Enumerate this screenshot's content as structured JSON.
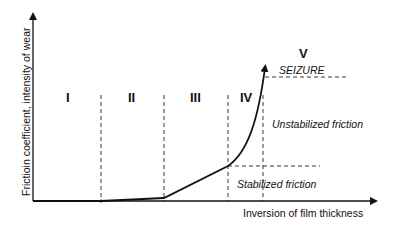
{
  "diagram": {
    "y_axis_label": "Frictioin coefficient, intensity of wear",
    "x_axis_label": "Inversion of film thickness",
    "regions": [
      {
        "id": "I",
        "label": "I"
      },
      {
        "id": "II",
        "label": "II"
      },
      {
        "id": "III",
        "label": "III"
      },
      {
        "id": "IV",
        "label": "IV"
      },
      {
        "id": "V",
        "label": "V"
      }
    ],
    "annotations": {
      "seizure": "SEIZURE",
      "unstabilized": "Unstabilized friction",
      "stabilized": "Stabilized friction"
    },
    "colors": {
      "line": "#111111",
      "background": "#ffffff"
    }
  }
}
